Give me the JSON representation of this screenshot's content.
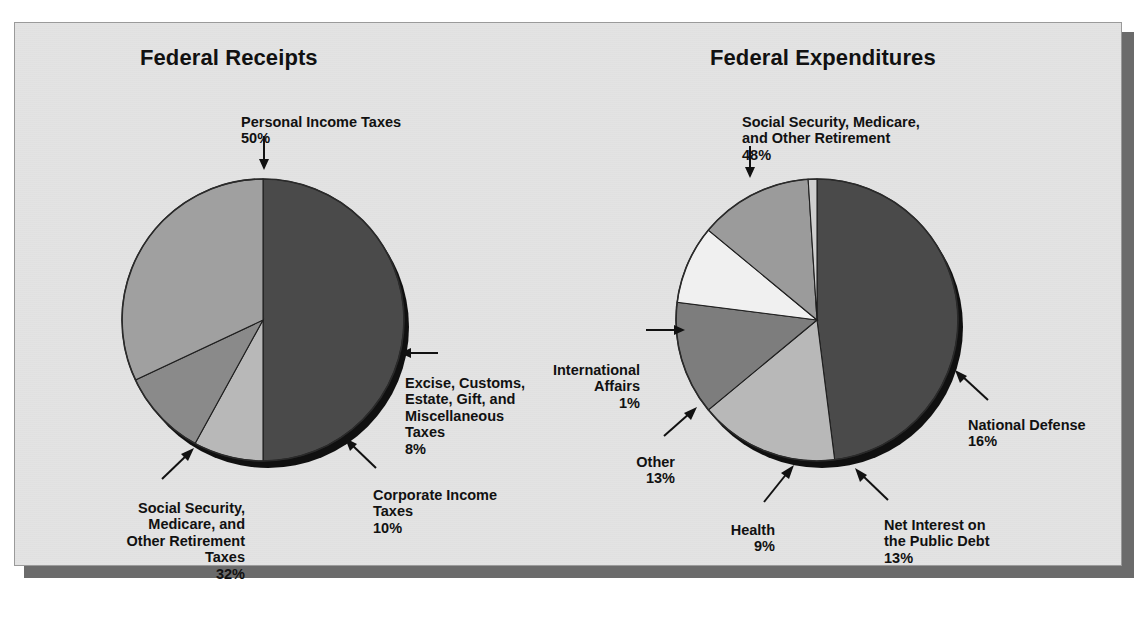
{
  "page": {
    "cut_off_header": "",
    "background_color": "#ffffff",
    "panel_color": "#e3e3e3",
    "panel_border_color": "#9a9a9a",
    "shadow_color": "#6b6b6b"
  },
  "charts": {
    "left": {
      "title": "Federal Receipts"
    },
    "right": {
      "title": "Federal Expenditures"
    }
  },
  "labels": {
    "left": {
      "personal_income": {
        "text": "Personal Income Taxes",
        "pct": "50%"
      },
      "excise": {
        "text": "Excise, Customs,\nEstate, Gift, and\nMiscellaneous\nTaxes",
        "pct": "8%"
      },
      "corporate": {
        "text": "Corporate Income\nTaxes",
        "pct": "10%"
      },
      "social_security": {
        "text": "Social Security,\nMedicare, and\nOther Retirement\nTaxes",
        "pct": "32%"
      }
    },
    "right": {
      "social_security": {
        "text": "Social Security, Medicare,\nand Other Retirement",
        "pct": "48%"
      },
      "national_defense": {
        "text": "National Defense",
        "pct": "16%"
      },
      "net_interest": {
        "text": "Net Interest on\nthe Public Debt",
        "pct": "13%"
      },
      "health": {
        "text": "Health",
        "pct": "9%"
      },
      "other": {
        "text": "Other",
        "pct": "13%"
      },
      "international": {
        "text": "International\nAffairs",
        "pct": "1%"
      }
    }
  },
  "chart_data": [
    {
      "type": "pie",
      "title": "Federal Receipts",
      "categories": [
        "Personal Income Taxes",
        "Excise, Customs, Estate, Gift, and Miscellaneous Taxes",
        "Corporate Income Taxes",
        "Social Security, Medicare, and Other Retirement Taxes"
      ],
      "values": [
        50,
        8,
        10,
        32
      ],
      "units": "percent",
      "colors": [
        "#4a4a4a",
        "#b8b8b8",
        "#8a8a8a",
        "#a0a0a0"
      ],
      "start_angle_deg": 270,
      "direction": "clockwise",
      "legend": "none",
      "labels_as_callouts": true
    },
    {
      "type": "pie",
      "title": "Federal Expenditures",
      "categories": [
        "Social Security, Medicare, and Other Retirement",
        "National Defense",
        "Net Interest on the Public Debt",
        "Health",
        "Other",
        "International Affairs"
      ],
      "values": [
        48,
        16,
        13,
        9,
        13,
        1
      ],
      "units": "percent",
      "colors": [
        "#4a4a4a",
        "#b8b8b8",
        "#7d7d7d",
        "#f0f0f0",
        "#9b9b9b",
        "#cfcfcf"
      ],
      "start_angle_deg": 270,
      "direction": "clockwise",
      "legend": "none",
      "labels_as_callouts": true
    }
  ]
}
